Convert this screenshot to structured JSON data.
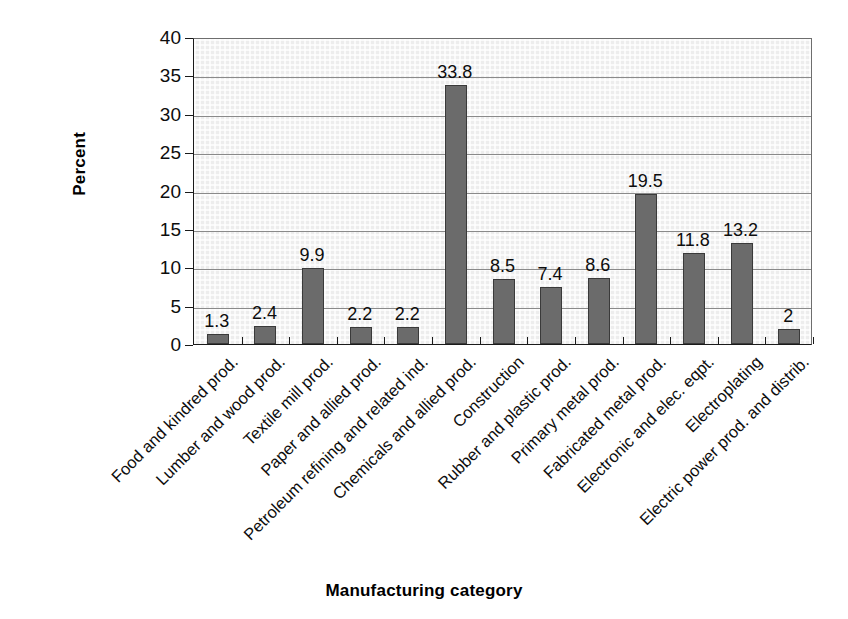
{
  "chart_data": {
    "type": "bar",
    "title": "",
    "xlabel": "Manufacturing category",
    "ylabel": "Percent",
    "ylim": [
      0,
      40
    ],
    "ytick_step": 5,
    "yticks": [
      "40",
      "35",
      "30",
      "25",
      "20",
      "15",
      "10",
      "5",
      "0"
    ],
    "grid": "horizontal",
    "legend": "none",
    "categories": [
      "Food and kindred prod.",
      "Lumber and wood prod.",
      "Textile mill prod.",
      "Paper and allied prod.",
      "Petroleum refining and related ind.",
      "Chemicals and allied prod.",
      "Construction",
      "Rubber and plastic prod.",
      "Primary metal prod.",
      "Fabricated metal prod.",
      "Electronic and elec. eqpt.",
      "Electroplating",
      "Electric power prod. and distrib."
    ],
    "values": [
      1.3,
      2.4,
      9.9,
      2.2,
      2.2,
      33.8,
      8.5,
      7.4,
      8.6,
      19.5,
      11.8,
      13.2,
      2
    ],
    "value_labels": [
      "1.3",
      "2.4",
      "9.9",
      "2.2",
      "2.2",
      "33.8",
      "8.5",
      "7.4",
      "8.6",
      "19.5",
      "11.8",
      "13.2",
      "2"
    ]
  },
  "style": {
    "bar_fill": "#6b6b6b",
    "bar_edge": "#3a3a3a",
    "plot_background": "#ededed",
    "gridline_color": "#8a8a8a",
    "axis_color": "#1a1a1a",
    "text_color": "#0d0d0d",
    "page_background": "#ffffff"
  }
}
